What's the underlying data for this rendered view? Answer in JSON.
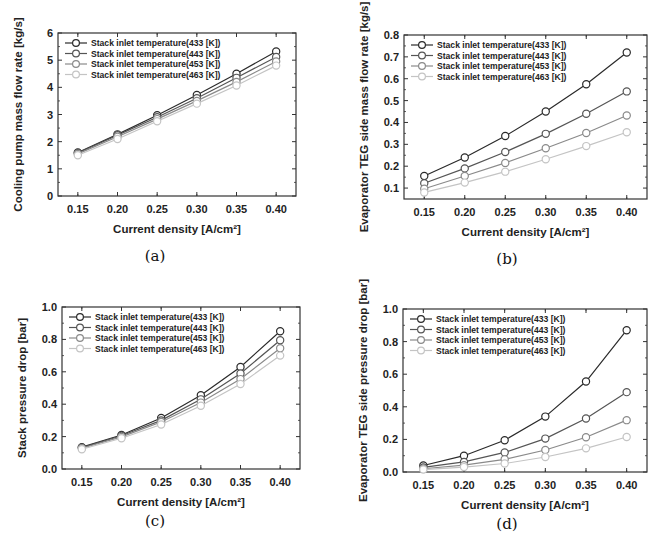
{
  "figure": {
    "panels": [
      "a",
      "b",
      "c",
      "d"
    ]
  },
  "chart_data": [
    {
      "id": "a",
      "caption": "(a)",
      "type": "line",
      "title": "",
      "xlabel": "Current density [A/cm²]",
      "ylabel": "Cooling pump mass flow rate [kg/s]",
      "x": [
        0.15,
        0.2,
        0.25,
        0.3,
        0.35,
        0.4
      ],
      "x_tick_labels": [
        "0.15",
        "0.20",
        "0.25",
        "0.30",
        "0.35",
        "0.40"
      ],
      "xlim": [
        0.125,
        0.425
      ],
      "ylim": [
        0,
        6
      ],
      "y_ticks": [
        0,
        1,
        2,
        3,
        4,
        5,
        6
      ],
      "y_tick_labels": [
        "0",
        "1",
        "2",
        "3",
        "4",
        "5",
        "6"
      ],
      "grid": false,
      "legend_position": "upper left",
      "series": [
        {
          "name": "Stack inlet temperature(433 [K])",
          "color": "#2a2a2a",
          "values": [
            1.6,
            2.27,
            2.97,
            3.72,
            4.5,
            5.32
          ]
        },
        {
          "name": "Stack inlet temperature(443 [K])",
          "color": "#555555",
          "values": [
            1.58,
            2.24,
            2.9,
            3.6,
            4.35,
            5.12
          ]
        },
        {
          "name": "Stack inlet temperature(453 [K])",
          "color": "#8a8a8a",
          "values": [
            1.55,
            2.18,
            2.83,
            3.5,
            4.2,
            4.95
          ]
        },
        {
          "name": "Stack inlet temperature(463 [K])",
          "color": "#c4c4c4",
          "values": [
            1.5,
            2.1,
            2.75,
            3.4,
            4.07,
            4.8
          ]
        }
      ]
    },
    {
      "id": "b",
      "caption": "(b)",
      "type": "line",
      "title": "",
      "xlabel": "Current density [A/cm²]",
      "ylabel": "Evaporator TEG side mass flow rate [kg/s]",
      "x": [
        0.15,
        0.2,
        0.25,
        0.3,
        0.35,
        0.4
      ],
      "x_tick_labels": [
        "0.15",
        "0.20",
        "0.25",
        "0.30",
        "0.35",
        "0.40"
      ],
      "xlim": [
        0.125,
        0.425
      ],
      "ylim": [
        0.05,
        0.8
      ],
      "y_ticks": [
        0.1,
        0.2,
        0.3,
        0.4,
        0.5,
        0.6,
        0.7,
        0.8
      ],
      "y_tick_labels": [
        "0.1",
        "0.2",
        "0.3",
        "0.4",
        "0.5",
        "0.6",
        "0.7",
        "0.8"
      ],
      "grid": false,
      "legend_position": "upper left",
      "series": [
        {
          "name": "Stack inlet temperature(433 [K])",
          "color": "#2a2a2a",
          "values": [
            0.155,
            0.24,
            0.338,
            0.45,
            0.575,
            0.72
          ]
        },
        {
          "name": "Stack inlet temperature(443 [K])",
          "color": "#555555",
          "values": [
            0.122,
            0.19,
            0.265,
            0.348,
            0.44,
            0.542
          ]
        },
        {
          "name": "Stack inlet temperature(453 [K])",
          "color": "#8a8a8a",
          "values": [
            0.097,
            0.155,
            0.215,
            0.282,
            0.352,
            0.432
          ]
        },
        {
          "name": "Stack inlet temperature(463 [K])",
          "color": "#c4c4c4",
          "values": [
            0.08,
            0.125,
            0.175,
            0.232,
            0.292,
            0.355
          ]
        }
      ]
    },
    {
      "id": "c",
      "caption": "(c)",
      "type": "line",
      "title": "",
      "xlabel": "Current density [A/cm²]",
      "ylabel": "Stack pressure drop [bar]",
      "x": [
        0.15,
        0.2,
        0.25,
        0.3,
        0.35,
        0.4
      ],
      "x_tick_labels": [
        "0.15",
        "0.20",
        "0.25",
        "0.30",
        "0.35",
        "0.40"
      ],
      "xlim": [
        0.125,
        0.425
      ],
      "ylim": [
        0,
        1.0
      ],
      "y_ticks": [
        0.0,
        0.2,
        0.4,
        0.6,
        0.8,
        1.0
      ],
      "y_tick_labels": [
        "0.0",
        "0.2",
        "0.4",
        "0.6",
        "0.8",
        "1.0"
      ],
      "grid": false,
      "legend_position": "upper left",
      "series": [
        {
          "name": "Stack inlet temperature(433 [K])",
          "color": "#2a2a2a",
          "values": [
            0.135,
            0.21,
            0.315,
            0.455,
            0.63,
            0.85
          ]
        },
        {
          "name": "Stack inlet temperature(443 [K])",
          "color": "#555555",
          "values": [
            0.132,
            0.205,
            0.3,
            0.43,
            0.59,
            0.795
          ]
        },
        {
          "name": "Stack inlet temperature(453 [K])",
          "color": "#8a8a8a",
          "values": [
            0.128,
            0.198,
            0.29,
            0.41,
            0.555,
            0.745
          ]
        },
        {
          "name": "Stack inlet temperature(463 [K])",
          "color": "#c4c4c4",
          "values": [
            0.122,
            0.19,
            0.275,
            0.39,
            0.525,
            0.7
          ]
        }
      ]
    },
    {
      "id": "d",
      "caption": "(d)",
      "type": "line",
      "title": "",
      "xlabel": "Current density [A/cm²]",
      "ylabel": "Evaporator TEG side pressure drop [bar]",
      "x": [
        0.15,
        0.2,
        0.25,
        0.3,
        0.35,
        0.4
      ],
      "x_tick_labels": [
        "0.15",
        "0.20",
        "0.25",
        "0.30",
        "0.35",
        "0.40"
      ],
      "xlim": [
        0.125,
        0.425
      ],
      "ylim": [
        0,
        1.0
      ],
      "y_ticks": [
        0.0,
        0.2,
        0.4,
        0.6,
        0.8,
        1.0
      ],
      "y_tick_labels": [
        "0.0",
        "0.2",
        "0.4",
        "0.6",
        "0.8",
        "1.0"
      ],
      "grid": false,
      "legend_position": "upper left",
      "series": [
        {
          "name": "Stack inlet temperature(433 [K])",
          "color": "#2a2a2a",
          "values": [
            0.04,
            0.1,
            0.195,
            0.34,
            0.555,
            0.87
          ]
        },
        {
          "name": "Stack inlet temperature(443 [K])",
          "color": "#555555",
          "values": [
            0.028,
            0.062,
            0.12,
            0.205,
            0.328,
            0.49
          ]
        },
        {
          "name": "Stack inlet temperature(453 [K])",
          "color": "#8a8a8a",
          "values": [
            0.02,
            0.042,
            0.078,
            0.135,
            0.213,
            0.318
          ]
        },
        {
          "name": "Stack inlet temperature(463 [K])",
          "color": "#c4c4c4",
          "values": [
            0.015,
            0.03,
            0.052,
            0.092,
            0.145,
            0.215
          ]
        }
      ]
    }
  ]
}
